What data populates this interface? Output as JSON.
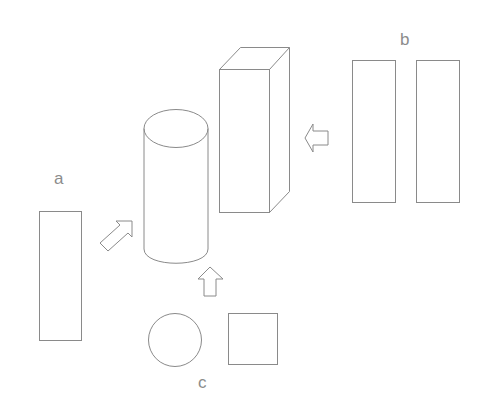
{
  "diagram": {
    "labels": {
      "a": "a",
      "b": "b",
      "c": "c"
    },
    "groups": [
      {
        "id": "a",
        "label": "a",
        "shapes": [
          "tall-rectangle"
        ]
      },
      {
        "id": "b",
        "label": "b",
        "shapes": [
          "tall-rectangle",
          "tall-rectangle"
        ]
      },
      {
        "id": "c",
        "label": "c",
        "shapes": [
          "circle",
          "square"
        ]
      }
    ],
    "composites": [
      {
        "shape": "cylinder",
        "formed_from": "a"
      },
      {
        "shape": "rectangular-prism",
        "formed_from": "b"
      }
    ],
    "arrows": [
      {
        "from": "a",
        "to": "cylinder",
        "direction": "up-right"
      },
      {
        "from": "b",
        "to": "rectangular-prism",
        "direction": "left"
      },
      {
        "from": "c",
        "to": "cylinder",
        "direction": "up"
      }
    ],
    "stroke_color": "#8a8a8a",
    "label_color": "#8c8c8c",
    "background": "#ffffff"
  }
}
